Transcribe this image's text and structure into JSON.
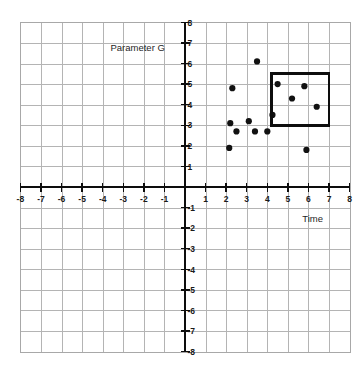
{
  "figure": {
    "kind": "coordinate-grid-scatter",
    "background_color": "#ffffff",
    "grid_color": "#b4b4b4",
    "axis_color": "#0d0d0d",
    "point_color": "#111111",
    "highlight_color": "#0d0d0d"
  },
  "labels": {
    "y_axis_title": "Parameter G",
    "x_axis_title": "Time"
  },
  "chart_data": {
    "type": "scatter",
    "title": "",
    "subtitle": "",
    "xlabel": "Time",
    "ylabel": "Parameter G",
    "xlim": [
      -8,
      8
    ],
    "ylim": [
      -8,
      8
    ],
    "grid": true,
    "grid_step": 1,
    "legend": null,
    "legend_position": "none",
    "x_tick_labels": [
      "-8",
      "-7",
      "-6",
      "-5",
      "-4",
      "-3",
      "-2",
      "-1",
      "1",
      "2",
      "3",
      "4",
      "5",
      "6",
      "7",
      "8"
    ],
    "x_tick_values": [
      -8,
      -7,
      -6,
      -5,
      -4,
      -3,
      -2,
      -1,
      1,
      2,
      3,
      4,
      5,
      6,
      7,
      8
    ],
    "y_tick_labels": [
      "8",
      "7",
      "6",
      "5",
      "4",
      "3",
      "2",
      "1",
      "-1",
      "-2",
      "-3",
      "-4",
      "-5",
      "-6",
      "-7",
      "-8"
    ],
    "y_tick_values": [
      8,
      7,
      6,
      5,
      4,
      3,
      2,
      1,
      -1,
      -2,
      -3,
      -4,
      -5,
      -6,
      -7,
      -8
    ],
    "point_radius": 3.1,
    "points": [
      {
        "x": 3.5,
        "y": 6.1
      },
      {
        "x": 2.3,
        "y": 4.8
      },
      {
        "x": 4.5,
        "y": 5.0
      },
      {
        "x": 5.8,
        "y": 4.9
      },
      {
        "x": 5.2,
        "y": 4.3
      },
      {
        "x": 6.4,
        "y": 3.9
      },
      {
        "x": 4.25,
        "y": 3.5
      },
      {
        "x": 2.2,
        "y": 3.1
      },
      {
        "x": 3.1,
        "y": 3.2
      },
      {
        "x": 2.5,
        "y": 2.7
      },
      {
        "x": 3.4,
        "y": 2.7
      },
      {
        "x": 4.0,
        "y": 2.7
      },
      {
        "x": 2.15,
        "y": 1.9
      },
      {
        "x": 5.9,
        "y": 1.8
      }
    ],
    "annotations": [
      {
        "kind": "rectangle",
        "label": "selection-box",
        "x0": 4.2,
        "y0": 3.0,
        "x1": 7.0,
        "y1": 5.5,
        "enclosed_point_count": 4
      },
      {
        "kind": "text",
        "label": "y-axis-title",
        "text": "Parameter G",
        "x": -2.3,
        "y": 6.75
      },
      {
        "kind": "text",
        "label": "x-axis-title",
        "text": "Time",
        "x": 6.2,
        "y": -1.55
      }
    ]
  }
}
